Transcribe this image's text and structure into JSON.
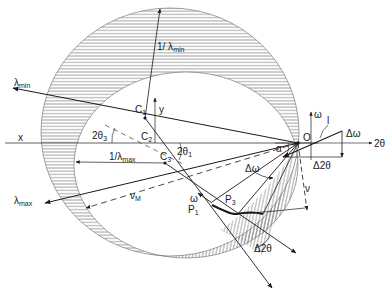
{
  "figure": {
    "type": "Ewald sphere construction (white-radiation diffraction)",
    "colors": {
      "ink": "#1a1a1a",
      "hatch": "#555555",
      "background": "#ffffff"
    }
  },
  "labels": {
    "lambda_min": "λ",
    "lambda_min_sub": "min",
    "inv_lambda_min": "1/ λ",
    "inv_lambda_min_sub": "min",
    "lambda_max": "λ",
    "lambda_max_sub": "max",
    "inv_lambda_max": "1/λ",
    "inv_lambda_max_sub": "max",
    "c1": "C",
    "c1_sub": "1",
    "c2": "C",
    "c2_sub": "2",
    "c3": "C",
    "c3_sub": "3",
    "origin": "O",
    "x_axis": "x",
    "y_axis": "y",
    "two_theta_3": "2θ",
    "two_theta_3_sub": "3",
    "two_theta_1": "2θ",
    "two_theta_1_sub": "1",
    "nu_m": "ν",
    "nu_m_sub": "M",
    "nu": "ν",
    "delta_omega": "Δω",
    "omega": "ω",
    "p1": "P",
    "p1_sub": "1",
    "p3": "P",
    "p3_sub": "3",
    "delta_two_theta": "Δ2θ"
  },
  "inset": {
    "omega_axis": "ω",
    "two_theta_axis": "2θ",
    "line_label": "l",
    "delta_omega": "Δω",
    "delta_two_theta": "Δ2θ",
    "alpha": "α"
  }
}
